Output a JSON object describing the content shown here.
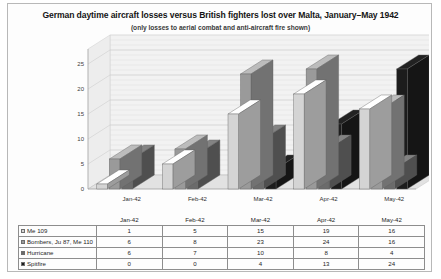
{
  "chart_data": {
    "type": "bar",
    "title": "German daytime aircraft losses versus British fighters lost over Malta, January–May 1942",
    "subtitle": "(only losses to aerial combat and anti-aircraft fire shown)",
    "xlabel": "",
    "ylabel": "",
    "categories": [
      "Jan-42",
      "Feb-42",
      "Mar-42",
      "Apr-42",
      "May-42"
    ],
    "yticks": [
      0,
      5,
      10,
      15,
      20,
      25
    ],
    "ylim": [
      0,
      28
    ],
    "grid": true,
    "legend_position": "table-below",
    "three_d": true,
    "series": [
      {
        "name": "Me 109",
        "values": [
          1,
          5,
          15,
          19,
          16
        ],
        "color": "#d4d4d4"
      },
      {
        "name": "Bombers, Ju 87, Me 110",
        "values": [
          6,
          8,
          23,
          24,
          16
        ],
        "color": "#9a9a9a"
      },
      {
        "name": "Hurricane",
        "values": [
          6,
          7,
          10,
          8,
          4
        ],
        "color": "#6b6b6b"
      },
      {
        "name": "Spitfire",
        "values": [
          0,
          0,
          4,
          13,
          24
        ],
        "color": "#1c1c1c"
      }
    ]
  },
  "table": {
    "corner": "",
    "headers": [
      "Jan-42",
      "Feb-42",
      "Mar-42",
      "Apr-42",
      "May-42"
    ],
    "rows": [
      {
        "label": "Me 109",
        "values": [
          "1",
          "5",
          "15",
          "19",
          "16"
        ]
      },
      {
        "label": "Bombers, Ju 87, Me 110",
        "values": [
          "6",
          "8",
          "23",
          "24",
          "16"
        ]
      },
      {
        "label": "Hurricane",
        "values": [
          "6",
          "7",
          "10",
          "8",
          "4"
        ]
      },
      {
        "label": "Spitfire",
        "values": [
          "0",
          "0",
          "4",
          "13",
          "24"
        ]
      }
    ]
  },
  "colors": {
    "wall": "#f2f2f2",
    "floor": "#e2e2e2",
    "gridline": "#c9c9c9",
    "frame_border": "#b8b8b8"
  }
}
